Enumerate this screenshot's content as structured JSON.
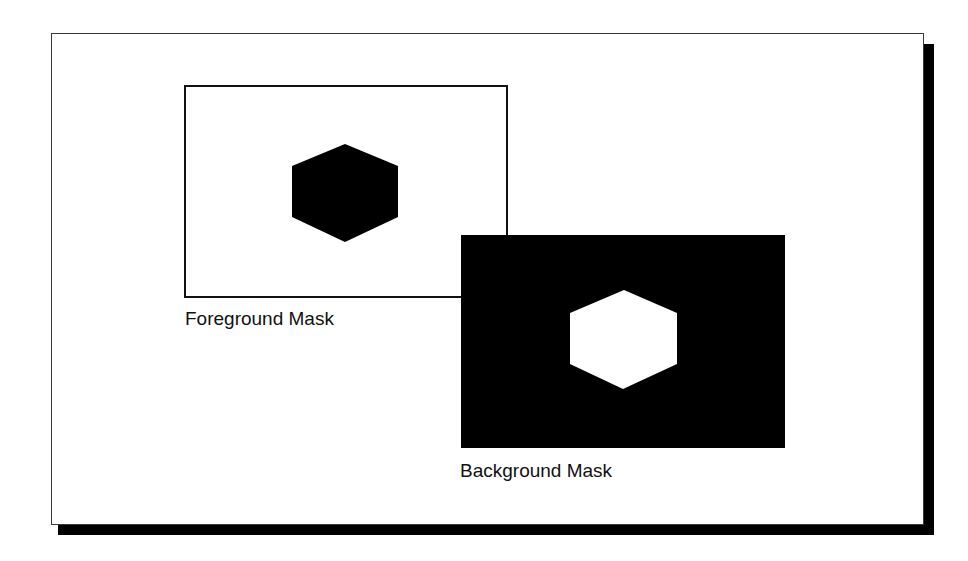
{
  "diagram": {
    "foreground": {
      "label": "Foreground Mask",
      "box_fill": "#ffffff",
      "box_border": "#111111",
      "shape": "hexagon",
      "shape_fill": "#000000"
    },
    "background": {
      "label": "Background Mask",
      "box_fill": "#000000",
      "shape": "hexagon",
      "shape_fill": "#ffffff"
    },
    "frame": {
      "fill": "#ffffff",
      "shadow": "#000000"
    }
  }
}
